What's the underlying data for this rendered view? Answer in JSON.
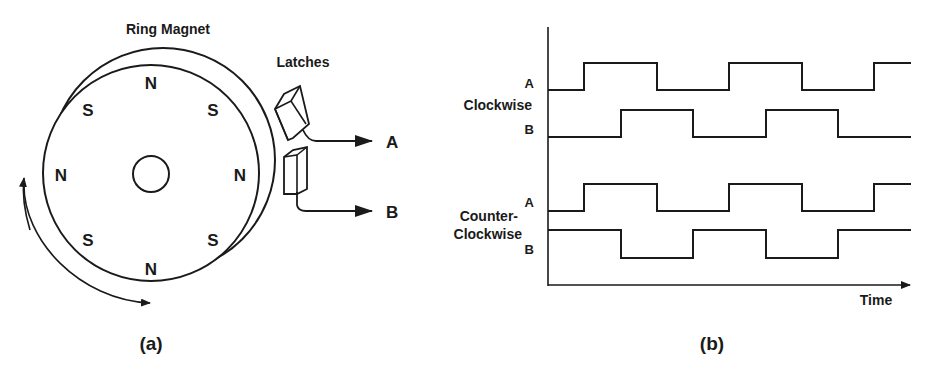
{
  "panel_a": {
    "caption": "(a)",
    "ring_label": "Ring Magnet",
    "latches_label": "Latches",
    "output_a": "A",
    "output_b": "B",
    "poles": [
      {
        "label": "N",
        "x": 151,
        "y": 87
      },
      {
        "label": "S",
        "x": 90,
        "y": 112
      },
      {
        "label": "S",
        "x": 212,
        "y": 112
      },
      {
        "label": "N",
        "x": 62,
        "y": 182
      },
      {
        "label": "N",
        "x": 240,
        "y": 182
      },
      {
        "label": "S",
        "x": 90,
        "y": 243
      },
      {
        "label": "S",
        "x": 212,
        "y": 243
      },
      {
        "label": "N",
        "x": 151,
        "y": 272
      }
    ]
  },
  "panel_b": {
    "caption": "(b)",
    "group_clockwise": "Clockwise",
    "group_counter_line1": "Counter-",
    "group_counter_line2": "Clockwise",
    "cw_a": "A",
    "cw_b": "B",
    "ccw_a": "A",
    "ccw_b": "B",
    "time_label": "Time"
  },
  "colors": {
    "ink": "#1a1a1a",
    "background": "#ffffff"
  }
}
